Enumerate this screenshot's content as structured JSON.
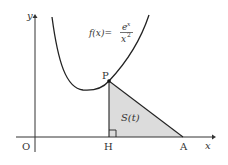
{
  "diagram": {
    "function_label": {
      "lhs": "f(x)=",
      "num": "e",
      "num_exp": "x",
      "den": "x",
      "den_exp": "2"
    },
    "axis_labels": {
      "x": "x",
      "y": "y"
    },
    "points": {
      "origin": "O",
      "P": "P",
      "H": "H",
      "A": "A"
    },
    "region_label": "S(t)",
    "colors": {
      "curve": "#222222",
      "region_fill": "#dcdcdc",
      "axis": "#333333"
    }
  }
}
